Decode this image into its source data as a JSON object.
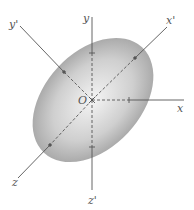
{
  "diagram": {
    "type": "ellipsoid-principal-axes",
    "origin_label": "O",
    "ellipsoid": {
      "cx": 93,
      "cy": 100,
      "rx": 72,
      "ry": 48,
      "rotation_deg": -47,
      "fill_center": "#f4f4f4",
      "fill_edge": "#a8a8a8"
    },
    "axes": [
      {
        "name": "y",
        "label": "y",
        "x2": 92,
        "y2": 17,
        "lx": 84,
        "ly": 23,
        "tick": [
          92,
          53
        ]
      },
      {
        "name": "x",
        "label": "x",
        "x2": 184,
        "y2": 100,
        "lx": 177,
        "ly": 112,
        "tick": [
          129,
          100
        ]
      },
      {
        "name": "z'",
        "label": "z'",
        "x2": 92,
        "y2": 190,
        "lx": 89,
        "ly": 203,
        "tick": [
          92,
          147
        ]
      },
      {
        "name": "x'",
        "label": "x'",
        "x2": 167,
        "y2": 27,
        "lx": 168,
        "ly": 24,
        "tick": [
          135,
          58
        ]
      },
      {
        "name": "y'",
        "label": "y'",
        "x2": 20,
        "y2": 26,
        "lx": 10,
        "ly": 27,
        "tick": [
          64,
          72
        ]
      },
      {
        "name": "z",
        "label": "z",
        "x2": 18,
        "y2": 178,
        "lx": 12,
        "ly": 185,
        "tick": [
          50,
          145
        ]
      }
    ],
    "colors": {
      "axis": "#555555",
      "label": "#555555"
    }
  }
}
